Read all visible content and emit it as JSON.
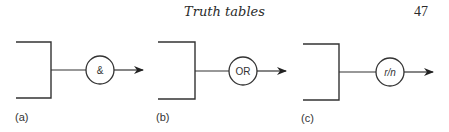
{
  "header": {
    "running_title": "Truth tables",
    "page_number": "47"
  },
  "figures": [
    {
      "id": "a",
      "label": "(a)",
      "gate_symbol": "&",
      "gate_meaning": "AND"
    },
    {
      "id": "b",
      "label": "(b)",
      "gate_symbol": "OR",
      "gate_meaning": "OR"
    },
    {
      "id": "c",
      "label": "(c)",
      "gate_symbol": "r/n",
      "gate_meaning": "r out of n"
    }
  ],
  "colors": {
    "line": "#333333",
    "text": "#2a2a2a",
    "background": "#ffffff"
  }
}
